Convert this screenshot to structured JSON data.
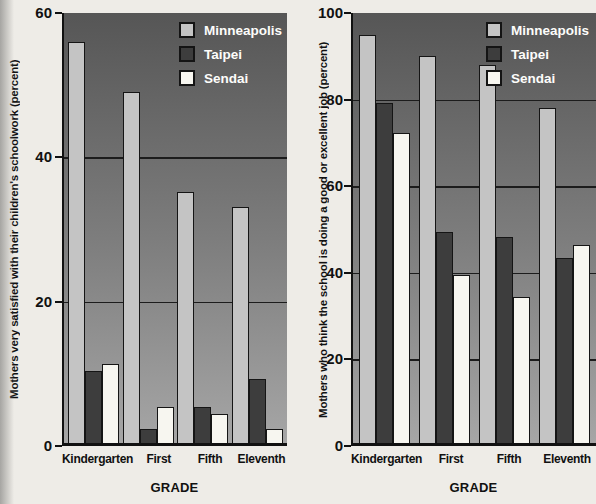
{
  "figure": {
    "description_left": "Mothers very satisfied with their children's schoolwork by grade and city",
    "description_right": "Mothers who think the school is doing a good or excellent job by grade and city"
  },
  "colors": {
    "page_background": "#eeece7",
    "plot_gradient_top": "#565656",
    "plot_gradient_bottom": "#a6a6a6",
    "minneapolis_bar": "#c4c4c4",
    "taipei_bar": "#3d3d3d",
    "sendai_bar": "#f7f6f0",
    "gridline": "#1c1c1c",
    "legend_text": "#fdfdfb",
    "axis_text": "#111111"
  },
  "chart_data": [
    {
      "type": "bar",
      "title": "",
      "categories": [
        "Kindergarten",
        "First",
        "Fifth",
        "Eleventh"
      ],
      "series": [
        {
          "name": "Minneapolis",
          "color": "#c4c4c4",
          "values": [
            56,
            49,
            35,
            33
          ]
        },
        {
          "name": "Taipei",
          "color": "#3d3d3d",
          "values": [
            10,
            2,
            5,
            9
          ]
        },
        {
          "name": "Sendai",
          "color": "#f7f6f0",
          "values": [
            11,
            5,
            4,
            2
          ]
        }
      ],
      "xlabel": "GRADE",
      "ylabel": "Mothers very satisfied with their children's schoolwork (percent)",
      "ylim": [
        0,
        60
      ],
      "yticks": [
        0,
        20,
        40,
        60
      ],
      "grid": true,
      "legend_position": "top-right",
      "plot_background": "gray-gradient"
    },
    {
      "type": "bar",
      "title": "",
      "categories": [
        "Kindergarten",
        "First",
        "Fifth",
        "Eleventh"
      ],
      "series": [
        {
          "name": "Minneapolis",
          "color": "#c4c4c4",
          "values": [
            95,
            90,
            88,
            78
          ]
        },
        {
          "name": "Taipei",
          "color": "#3d3d3d",
          "values": [
            79,
            49,
            48,
            43
          ]
        },
        {
          "name": "Sendai",
          "color": "#f7f6f0",
          "values": [
            72,
            39,
            34,
            46
          ]
        }
      ],
      "xlabel": "GRADE",
      "ylabel": "Mothers who think the school is doing a good or excellent job (percent)",
      "ylim": [
        0,
        100
      ],
      "yticks": [
        0,
        20,
        40,
        60,
        80,
        100
      ],
      "grid": true,
      "legend_position": "top-right",
      "plot_background": "gray-gradient"
    }
  ]
}
